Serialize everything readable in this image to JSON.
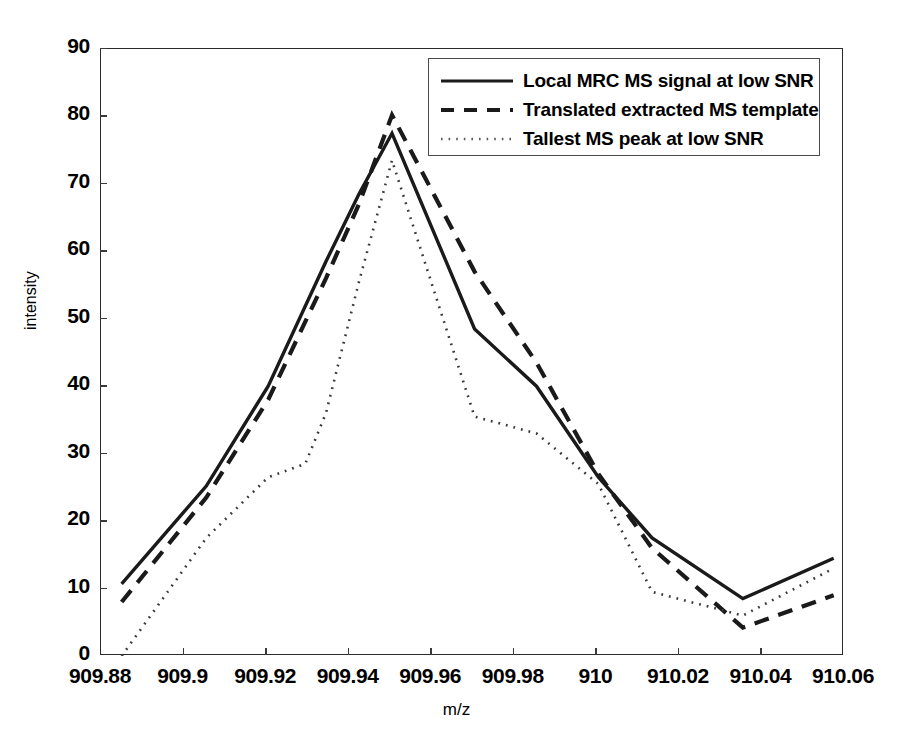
{
  "chart_data": {
    "type": "line",
    "title": "",
    "xlabel": "m/z",
    "ylabel": "intensity",
    "xlim": [
      909.88,
      910.06
    ],
    "ylim": [
      0,
      90
    ],
    "xticks": [
      909.88,
      909.9,
      909.92,
      909.94,
      909.96,
      909.98,
      910,
      910.02,
      910.04,
      910.06
    ],
    "xtick_labels": [
      "909.88",
      "909.9",
      "909.92",
      "909.94",
      "909.96",
      "909.98",
      "910",
      "910.02",
      "910.04",
      "910.06"
    ],
    "yticks": [
      0,
      10,
      20,
      30,
      40,
      50,
      60,
      70,
      80,
      90
    ],
    "ytick_labels": [
      "0",
      "10",
      "20",
      "30",
      "40",
      "50",
      "60",
      "70",
      "80",
      "90"
    ],
    "grid": false,
    "legend_position": "upper right",
    "series": [
      {
        "name": "Local MRC MS signal at low SNR",
        "style": "solid",
        "color": "#1a1a1a",
        "x": [
          909.885,
          909.9055,
          909.9205,
          909.9345,
          909.9425,
          909.9505,
          909.9705,
          909.9855,
          910.0005,
          910.0135,
          910.0355,
          910.0575
        ],
        "y": [
          10.7,
          25.2,
          40.0,
          58.5,
          68.5,
          77.5,
          48.5,
          40.0,
          26.5,
          17.5,
          8.5,
          14.5
        ]
      },
      {
        "name": "Translated extracted MS template",
        "style": "dashed",
        "color": "#1a1a1a",
        "x": [
          909.885,
          909.9055,
          909.9205,
          909.9345,
          909.9425,
          909.9505,
          909.9705,
          909.9855,
          910.0005,
          910.0135,
          910.0355,
          910.0575
        ],
        "y": [
          8.0,
          23.5,
          38.0,
          56.0,
          67.0,
          80.2,
          57.0,
          43.5,
          27.0,
          16.0,
          4.2,
          9.0
        ]
      },
      {
        "name": "Tallest MS peak at low SNR",
        "style": "dotted",
        "color": "#3a3a3a",
        "x": [
          909.885,
          909.9055,
          909.9205,
          909.9295,
          909.9345,
          909.9425,
          909.9505,
          909.9705,
          909.9855,
          910.0005,
          910.0135,
          910.0355,
          910.0575
        ],
        "y": [
          0.0,
          17.5,
          26.5,
          28.5,
          36.0,
          55.5,
          73.5,
          35.5,
          33.0,
          25.5,
          9.5,
          6.0,
          13.0
        ]
      }
    ]
  },
  "legend": {
    "entries": [
      {
        "label": "Local MRC MS signal at low SNR"
      },
      {
        "label": "Translated extracted MS template"
      },
      {
        "label": "Tallest MS peak at low SNR"
      }
    ]
  }
}
